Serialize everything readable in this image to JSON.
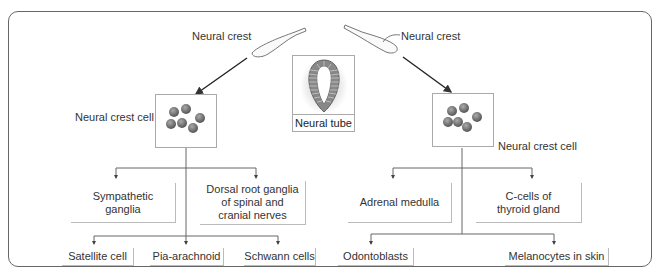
{
  "diagram": {
    "top_labels": {
      "left_neural_crest": "Neural crest",
      "right_neural_crest": "Neural crest",
      "neural_tube": "Neural tube"
    },
    "left_branch": {
      "cell_label": "Neural crest cell",
      "level1": [
        "Sympathetic\nganglia",
        "Dorsal root ganglia\nof spinal and\ncranial nerves"
      ],
      "level2": [
        "Satellite cell",
        "Pia-arachnoid",
        "Schwann cells"
      ]
    },
    "right_branch": {
      "cell_label": "Neural crest cell",
      "level1": [
        "Adrenal medulla",
        "C-cells of\nthyroid gland"
      ],
      "level2": [
        "Odontoblasts",
        "Melanocytes in skin"
      ]
    }
  },
  "colors": {
    "frame": "#666666",
    "line": "#555555",
    "cell": "#6b6b6b",
    "tube": "#777777"
  }
}
